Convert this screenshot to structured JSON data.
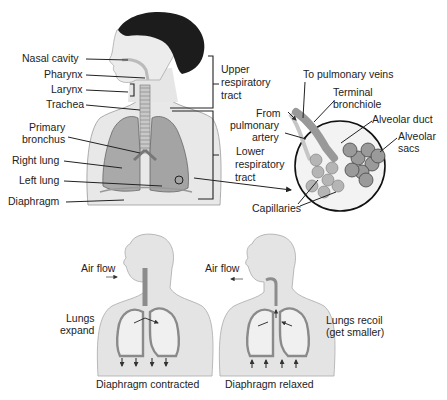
{
  "top_figure": {
    "labels": {
      "nasal_cavity": "Nasal cavity",
      "pharynx": "Pharynx",
      "larynx": "Larynx",
      "trachea": "Trachea",
      "primary_bronchus_1": "Primary",
      "primary_bronchus_2": "bronchus",
      "right_lung": "Right lung",
      "left_lung": "Left lung",
      "diaphragm": "Diaphragm",
      "upper_tract_1": "Upper",
      "upper_tract_2": "respiratory",
      "upper_tract_3": "tract",
      "lower_tract_1": "Lower",
      "lower_tract_2": "respiratory",
      "lower_tract_3": "tract"
    }
  },
  "alveoli_inset": {
    "labels": {
      "to_pulmonary_veins": "To pulmonary veins",
      "terminal_1": "Terminal",
      "terminal_2": "bronchiole",
      "from_1": "From",
      "from_2": "pulmonary",
      "from_3": "artery",
      "alveolar_duct": "Alveolar duct",
      "alveolar_sacs_1": "Alveolar",
      "alveolar_sacs_2": "sacs",
      "capillaries": "Capillaries"
    }
  },
  "inhalation": {
    "air_flow": "Air flow",
    "lungs_1": "Lungs",
    "lungs_2": "expand",
    "caption": "Diaphragm contracted"
  },
  "exhalation": {
    "air_flow": "Air flow",
    "lungs_1": "Lungs recoil",
    "lungs_2": "(get smaller)",
    "caption": "Diaphragm relaxed"
  },
  "colors": {
    "skin": "#e6e6e6",
    "lung": "#a9a9a9",
    "lung_dark": "#8a8a8a",
    "hair": "#1c1c1c",
    "text": "#222222"
  }
}
